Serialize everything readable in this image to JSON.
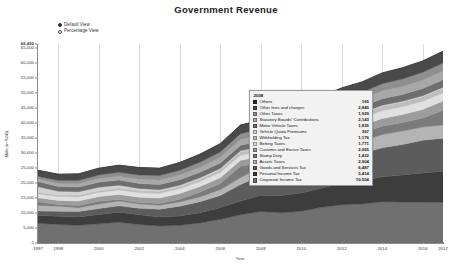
{
  "header": {
    "title": "Government Revenue"
  },
  "view_toggle": {
    "options": [
      {
        "label": "Default View",
        "selected": true
      },
      {
        "label": "Percentage View",
        "selected": false
      }
    ]
  },
  "tooltip": {
    "year": "2008",
    "rows": [
      {
        "label": "Others",
        "value": "165",
        "color": "#2b2b2b"
      },
      {
        "label": "Other fees and charges",
        "value": "2,845",
        "color": "#4a4a4a"
      },
      {
        "label": "Other Taxes",
        "value": "1,929",
        "color": "#8f8f8f"
      },
      {
        "label": "Statutory Boards' Contributions",
        "value": "2,143",
        "color": "#a8a8a8"
      },
      {
        "label": "Motor Vehicle Taxes",
        "value": "1,835",
        "color": "#6e6e6e"
      },
      {
        "label": "Vehicle Quota Premiums",
        "value": "367",
        "color": "#d2d2d2"
      },
      {
        "label": "Withholding Tax",
        "value": "1,176",
        "color": "#bdbdbd"
      },
      {
        "label": "Betting Taxes",
        "value": "1,771",
        "color": "#e0e0e0"
      },
      {
        "label": "Customs and Excise Taxes",
        "value": "2,065",
        "color": "#9c9c9c"
      },
      {
        "label": "Stamp Duty",
        "value": "1,432",
        "color": "#7b7b7b"
      },
      {
        "label": "Assets Taxes",
        "value": "2,904",
        "color": "#b4b4b4"
      },
      {
        "label": "Goods and Services Tax",
        "value": "6,487",
        "color": "#5c5c5c"
      },
      {
        "label": "Personal Income Tax",
        "value": "5,414",
        "color": "#3d3d3d"
      },
      {
        "label": "Corporate Income Tax",
        "value": "10,554",
        "color": "#707070"
      }
    ]
  },
  "chart_data": {
    "type": "area",
    "title": "Government Revenue",
    "xlabel": "Year",
    "ylabel": "$Mln (in SGD)",
    "ylim": [
      0,
      66450
    ],
    "grid": true,
    "stacked": true,
    "legend": "tooltip",
    "ytick_labels": [
      "66,450",
      "65,000",
      "60,000",
      "55,000",
      "50,000",
      "45,000",
      "40,000",
      "35,000",
      "30,000",
      "25,000",
      "20,000",
      "15,000",
      "10,000",
      "5,000",
      "0"
    ],
    "ytick_values": [
      66450,
      65000,
      60000,
      55000,
      50000,
      45000,
      40000,
      35000,
      30000,
      25000,
      20000,
      15000,
      10000,
      5000,
      0
    ],
    "xtick_labels": [
      "1997",
      "1998",
      "2000",
      "2002",
      "2004",
      "2006",
      "2008",
      "2010",
      "2012",
      "2014",
      "2016",
      "2017"
    ],
    "xtick_values": [
      1997,
      1998,
      2000,
      2002,
      2004,
      2006,
      2008,
      2010,
      2012,
      2014,
      2016,
      2017
    ],
    "x": [
      1997,
      1998,
      1999,
      2000,
      2001,
      2002,
      2003,
      2004,
      2005,
      2006,
      2007,
      2008,
      2009,
      2010,
      2011,
      2012,
      2013,
      2014,
      2015,
      2016,
      2017
    ],
    "series": [
      {
        "name": "Corporate Income Tax",
        "color": "#707070",
        "values": [
          6600,
          6200,
          5900,
          6400,
          6900,
          6200,
          5700,
          5900,
          6700,
          7900,
          9400,
          10554,
          10100,
          10600,
          11900,
          12800,
          13000,
          13800,
          13700,
          13600,
          13600
        ]
      },
      {
        "name": "Personal Income Tax",
        "color": "#3d3d3d",
        "values": [
          2600,
          2700,
          2800,
          3100,
          3400,
          3200,
          3000,
          3100,
          3400,
          3900,
          4600,
          5414,
          5800,
          6100,
          6500,
          7100,
          7700,
          8300,
          9000,
          9800,
          10400
        ]
      },
      {
        "name": "Goods and Services Tax",
        "color": "#5c5c5c",
        "values": [
          1500,
          1700,
          1800,
          2000,
          2100,
          2200,
          2600,
          3300,
          3700,
          4100,
          5500,
          6487,
          6900,
          7700,
          8200,
          8700,
          9200,
          9700,
          10200,
          10900,
          11000
        ]
      },
      {
        "name": "Assets Taxes",
        "color": "#b4b4b4",
        "values": [
          1800,
          1700,
          1300,
          1500,
          1600,
          1400,
          1300,
          1400,
          1600,
          1900,
          2300,
          2904,
          2400,
          2500,
          3400,
          3800,
          4100,
          4400,
          4500,
          4400,
          4400
        ]
      },
      {
        "name": "Stamp Duty",
        "color": "#7b7b7b",
        "values": [
          1300,
          500,
          700,
          900,
          500,
          500,
          600,
          900,
          1600,
          2100,
          3800,
          1432,
          1000,
          2800,
          3100,
          2900,
          2700,
          2800,
          2800,
          3000,
          4900
        ]
      },
      {
        "name": "Customs and Excise Taxes",
        "color": "#9c9c9c",
        "values": [
          1300,
          1400,
          1500,
          1600,
          1700,
          1800,
          1800,
          1900,
          1900,
          1900,
          2000,
          2065,
          2100,
          2200,
          2300,
          2400,
          2500,
          2600,
          2700,
          2900,
          3100
        ]
      },
      {
        "name": "Betting Taxes",
        "color": "#e0e0e0",
        "values": [
          1300,
          1300,
          1400,
          1400,
          1500,
          1500,
          1500,
          1600,
          1600,
          1700,
          1700,
          1771,
          1800,
          2000,
          2300,
          2400,
          2500,
          2600,
          2600,
          2700,
          2700
        ]
      },
      {
        "name": "Withholding Tax",
        "color": "#bdbdbd",
        "values": [
          500,
          500,
          600,
          600,
          700,
          700,
          800,
          800,
          900,
          1000,
          1100,
          1176,
          1200,
          1200,
          1300,
          1400,
          1400,
          1500,
          1500,
          1600,
          1600
        ]
      },
      {
        "name": "Vehicle Quota Premiums",
        "color": "#d2d2d2",
        "values": [
          1900,
          1300,
          1100,
          1100,
          900,
          700,
          500,
          400,
          400,
          400,
          400,
          367,
          300,
          300,
          300,
          300,
          300,
          300,
          300,
          300,
          300
        ]
      },
      {
        "name": "Motor Vehicle Taxes",
        "color": "#6e6e6e",
        "values": [
          1700,
          1600,
          1600,
          1700,
          1700,
          1700,
          1700,
          1800,
          1800,
          1800,
          1800,
          1835,
          1800,
          1900,
          2000,
          2000,
          2100,
          2200,
          2300,
          2400,
          2500
        ]
      },
      {
        "name": "Statutory Boards' Contributions",
        "color": "#a8a8a8",
        "values": [
          900,
          1000,
          1100,
          1200,
          1300,
          1400,
          1500,
          1600,
          1700,
          1900,
          2000,
          2143,
          2100,
          2200,
          2300,
          2400,
          2500,
          2600,
          2700,
          2800,
          2900
        ]
      },
      {
        "name": "Other Taxes",
        "color": "#8f8f8f",
        "values": [
          900,
          1000,
          1100,
          1200,
          1300,
          1400,
          1500,
          1600,
          1700,
          1800,
          1900,
          1929,
          1900,
          2000,
          2100,
          2200,
          2300,
          2400,
          2500,
          2600,
          2700
        ]
      },
      {
        "name": "Other fees and charges",
        "color": "#4a4a4a",
        "values": [
          1900,
          2000,
          2100,
          2200,
          2300,
          2400,
          2400,
          2500,
          2600,
          2700,
          2800,
          2845,
          2900,
          3000,
          3200,
          3300,
          3400,
          3500,
          3600,
          3700,
          3800
        ]
      },
      {
        "name": "Others",
        "color": "#2b2b2b",
        "values": [
          150,
          150,
          150,
          150,
          160,
          160,
          160,
          160,
          160,
          160,
          165,
          165,
          165,
          170,
          170,
          175,
          175,
          180,
          180,
          185,
          185
        ]
      }
    ]
  }
}
